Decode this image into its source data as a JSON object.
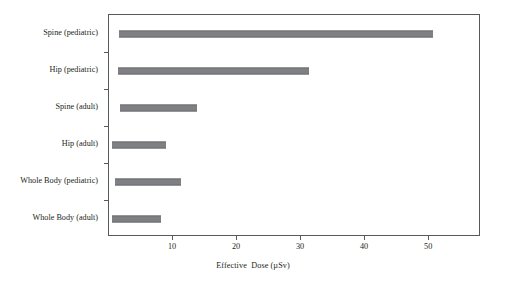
{
  "chart_data": {
    "type": "bar",
    "orientation": "horizontal",
    "title": "",
    "subtitle": "",
    "xlabel": "Effective  Dose (µSv)",
    "ylabel": "",
    "categories": [
      "Spine (pediatric)",
      "Hip (pediatric)",
      "Spine (adult)",
      "Hip (adult)",
      "Whole Body (pediatric)",
      "Whole Body (adult)"
    ],
    "range_bars": [
      {
        "category": "Spine (pediatric)",
        "low": 1.6,
        "high": 50.6
      },
      {
        "category": "Hip (pediatric)",
        "low": 1.4,
        "high": 31.3
      },
      {
        "category": "Spine (adult)",
        "low": 1.7,
        "high": 13.8
      },
      {
        "category": "Hip (adult)",
        "low": 0.5,
        "high": 8.9
      },
      {
        "category": "Whole Body (pediatric)",
        "low": 0.9,
        "high": 11.3
      },
      {
        "category": "Whole Body (adult)",
        "low": 0.5,
        "high": 8.1
      }
    ],
    "xlim": [
      0,
      58.1
    ],
    "ylim": [
      0,
      6
    ],
    "xticks": [
      10,
      20,
      30,
      40,
      50
    ],
    "xticklabels": [
      "10",
      "20",
      "30",
      "40",
      "50"
    ],
    "grid": false,
    "legend": null,
    "bar_color": "#7f8083",
    "axis_color": "#58595b",
    "background_color": "#ffffff"
  }
}
